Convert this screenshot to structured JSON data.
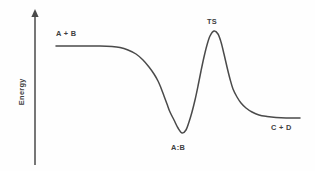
{
  "figure": {
    "background_color": "#fefefe",
    "line_color": "#4a4a4a",
    "text_color": "#3f3f3f"
  },
  "axis": {
    "y_label": "Energy",
    "arrow_icon": "up-arrow-icon"
  },
  "labels": {
    "reactants": "A + B",
    "transition_state": "TS",
    "intermediate": "A:B",
    "products": "C + D"
  },
  "chart_data": {
    "type": "line",
    "title": "",
    "subtitle": "",
    "xlabel": "",
    "ylabel": "Energy",
    "grid": false,
    "legend": "none",
    "x_axis_visible": false,
    "y_axis_visible": true,
    "y_axis_arrow": true,
    "xlim": [
      0,
      315
    ],
    "ylim": [
      171,
      0
    ],
    "tick_labels": {
      "x": [],
      "y": []
    },
    "series": [
      {
        "name": "reaction-energy-profile",
        "color": "#4a4a4a",
        "width": 1.5,
        "points": [
          [
            56,
            46
          ],
          [
            70,
            46
          ],
          [
            85,
            46
          ],
          [
            100,
            46
          ],
          [
            112,
            46.5
          ],
          [
            120,
            47.5
          ],
          [
            128,
            50
          ],
          [
            136,
            54
          ],
          [
            143,
            60
          ],
          [
            149,
            67
          ],
          [
            154,
            74
          ],
          [
            158,
            81
          ],
          [
            161,
            88
          ],
          [
            164,
            96
          ],
          [
            167,
            104
          ],
          [
            170,
            112
          ],
          [
            174,
            120
          ],
          [
            178,
            128
          ],
          [
            182,
            133
          ],
          [
            186,
            130
          ],
          [
            189,
            122
          ],
          [
            192,
            112
          ],
          [
            195,
            100
          ],
          [
            198,
            86
          ],
          [
            201,
            71
          ],
          [
            204,
            57
          ],
          [
            207,
            45
          ],
          [
            210,
            36
          ],
          [
            214,
            31
          ],
          [
            218,
            34
          ],
          [
            221,
            42
          ],
          [
            224,
            54
          ],
          [
            227,
            67
          ],
          [
            230,
            79
          ],
          [
            233,
            89
          ],
          [
            237,
            97
          ],
          [
            241,
            103
          ],
          [
            246,
            108
          ],
          [
            252,
            112
          ],
          [
            259,
            115
          ],
          [
            267,
            116.5
          ],
          [
            276,
            117.5
          ],
          [
            286,
            118
          ],
          [
            300,
            118
          ]
        ]
      }
    ],
    "annotations": [
      {
        "text": "A + B",
        "x": 68,
        "y": 34,
        "role": "reactants-label"
      },
      {
        "text": "TS",
        "x": 214,
        "y": 22,
        "role": "transition-state-label"
      },
      {
        "text": "A:B",
        "x": 181,
        "y": 148,
        "role": "intermediate-label"
      },
      {
        "text": "C + D",
        "x": 283,
        "y": 128,
        "role": "products-label"
      }
    ],
    "features": {
      "reactant_plateau_energy": 46,
      "intermediate_minimum_energy": 133,
      "transition_state_energy": 31,
      "product_plateau_energy": 118
    }
  }
}
